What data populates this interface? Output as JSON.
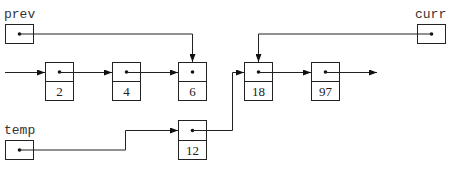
{
  "diagram": {
    "pointers": {
      "prev": {
        "label": "prev",
        "points_to": "6"
      },
      "curr": {
        "label": "curr",
        "points_to": "18"
      },
      "temp": {
        "label": "temp",
        "points_to": "12"
      }
    },
    "nodes": [
      {
        "value": "2"
      },
      {
        "value": "4"
      },
      {
        "value": "6"
      },
      {
        "value": "18"
      },
      {
        "value": "97"
      },
      {
        "value": "12"
      }
    ],
    "edges": [
      {
        "from": "head",
        "to": "2"
      },
      {
        "from": "2",
        "to": "4"
      },
      {
        "from": "4",
        "to": "6"
      },
      {
        "from": "12",
        "to": "18"
      },
      {
        "from": "18",
        "to": "97"
      },
      {
        "from": "97",
        "to": "next"
      }
    ],
    "colors": {
      "stroke": "#222222",
      "background": "#ffffff"
    }
  }
}
